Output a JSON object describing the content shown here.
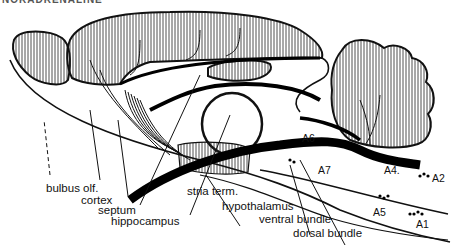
{
  "title": "NORADRENALINE",
  "figure": "Noradrenergic pathways in the rat brain (sagittal section)",
  "labels": {
    "bulbus_olf": "bulbus olf.",
    "cortex": "cortex",
    "septum": "septum",
    "hippocampus": "hippocampus",
    "stria_term": "stria term.",
    "hypothalamus": "hypothalamus",
    "ventral_bundle": "ventral bundle",
    "dorsal_bundle": "dorsal bundle",
    "A6": "A6",
    "A7": "A7",
    "A4": "A4.",
    "A2": "A2",
    "A5": "A5",
    "A1": "A1"
  },
  "colors": {
    "ink": "#111111",
    "background": "#ffffff"
  }
}
